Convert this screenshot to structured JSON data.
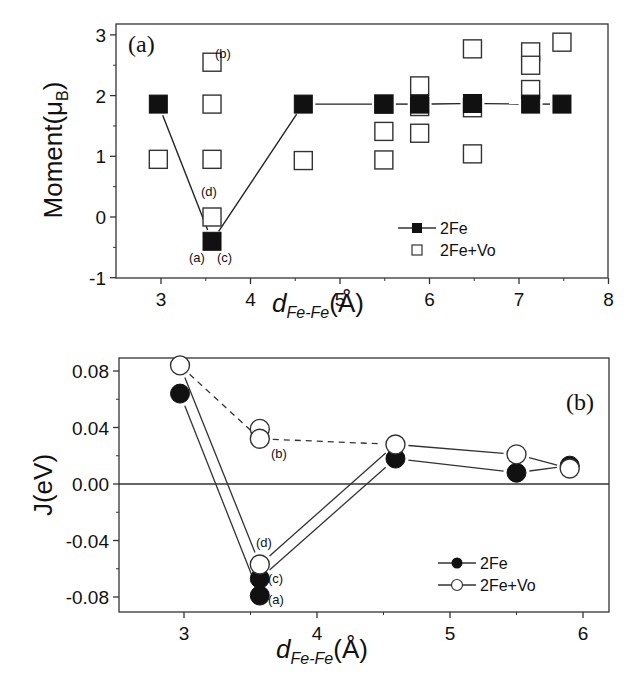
{
  "chart_data": [
    {
      "panel": "(a)",
      "type": "scatter",
      "xlabel": "d_Fe-Fe(Å)",
      "xlabel_main": "d",
      "xlabel_sub": "Fe-Fe",
      "xlabel_unit": "(Å)",
      "ylabel": "Moment(μB)",
      "ylabel_main": "Moment(μ",
      "ylabel_sub": "B",
      "ylabel_close": ")",
      "xlim": [
        2.5,
        8
      ],
      "ylim": [
        -1,
        3.1
      ],
      "xticks": [
        3,
        4,
        5,
        6,
        7,
        8
      ],
      "yticks": [
        -1,
        0,
        1,
        2,
        3
      ],
      "grid": false,
      "legend_position": "lower right",
      "series": [
        {
          "name": "2Fe",
          "marker": "filled-square",
          "line": "solid",
          "x": [
            2.97,
            3.57,
            4.59,
            5.49,
            5.89,
            6.48,
            7.13,
            7.48
          ],
          "y": [
            1.86,
            -0.4,
            1.86,
            1.86,
            1.86,
            1.87,
            1.86,
            1.86
          ]
        },
        {
          "name": "2Fe+Vo",
          "marker": "open-square",
          "line": "none",
          "x": [
            2.97,
            3.57,
            3.57,
            3.57,
            3.57,
            4.59,
            5.49,
            5.49,
            5.49,
            5.89,
            5.89,
            5.89,
            6.48,
            6.48,
            6.48,
            7.13,
            7.13,
            7.13,
            7.48
          ],
          "y": [
            0.95,
            2.55,
            1.86,
            0.95,
            0.0,
            0.93,
            1.86,
            1.41,
            0.94,
            2.16,
            1.82,
            1.38,
            2.77,
            1.8,
            1.04,
            2.72,
            2.5,
            2.1,
            2.88
          ]
        }
      ],
      "annotations": [
        {
          "text": "(b)",
          "x": 3.57,
          "y": 2.55
        },
        {
          "text": "(d)",
          "x": 3.57,
          "y": 0.0
        },
        {
          "text": "(a)",
          "x": 3.57,
          "y": -0.4
        },
        {
          "text": "(c)",
          "x": 3.57,
          "y": -0.4
        }
      ]
    },
    {
      "panel": "(b)",
      "type": "line",
      "xlabel": "d_Fe-Fe(Å)",
      "xlabel_main": "d",
      "xlabel_sub": "Fe-Fe",
      "xlabel_unit": "(Å)",
      "ylabel": "J(eV)",
      "xlim": [
        2.5,
        6.2
      ],
      "ylim": [
        -0.09,
        0.09
      ],
      "xticks": [
        3,
        4,
        5,
        6
      ],
      "yticks": [
        -0.08,
        -0.04,
        0.0,
        0.04,
        0.08
      ],
      "ytick_labels": [
        "-0.08",
        "-0.04",
        "0.00",
        "0.04",
        "0.08"
      ],
      "grid": false,
      "zero_line": true,
      "legend_position": "lower right",
      "series": [
        {
          "name": "2Fe",
          "marker": "filled-circle",
          "line": "solid",
          "x": [
            2.97,
            3.57,
            3.57,
            4.59,
            5.5,
            5.9
          ],
          "y": [
            0.064,
            -0.067,
            -0.079,
            0.018,
            0.008,
            0.013
          ]
        },
        {
          "name": "2Fe+Vo",
          "marker": "open-circle",
          "line": "solid",
          "x": [
            2.97,
            3.57,
            3.57,
            3.57,
            4.59,
            5.5,
            5.9
          ],
          "y": [
            0.084,
            0.039,
            0.032,
            -0.057,
            0.028,
            0.021,
            0.011
          ]
        }
      ],
      "lines": [
        {
          "style": "solid",
          "points": [
            [
              2.97,
              0.064
            ],
            [
              3.57,
              -0.079
            ]
          ]
        },
        {
          "style": "solid",
          "points": [
            [
              3.57,
              -0.067
            ],
            [
              4.59,
              0.018
            ],
            [
              5.5,
              0.008
            ],
            [
              5.9,
              0.013
            ]
          ]
        },
        {
          "style": "solid",
          "points": [
            [
              2.97,
              0.084
            ],
            [
              3.57,
              -0.057
            ],
            [
              4.59,
              0.028
            ],
            [
              5.5,
              0.021
            ],
            [
              5.9,
              0.011
            ]
          ]
        },
        {
          "style": "dashed",
          "points": [
            [
              2.97,
              0.084
            ],
            [
              3.57,
              0.032
            ],
            [
              4.59,
              0.028
            ]
          ]
        }
      ],
      "annotations": [
        {
          "text": "(b)",
          "x": 3.57,
          "y": 0.032
        },
        {
          "text": "(d)",
          "x": 3.57,
          "y": -0.057
        },
        {
          "text": "(c)",
          "x": 3.57,
          "y": -0.067
        },
        {
          "text": "(a)",
          "x": 3.57,
          "y": -0.079
        }
      ]
    }
  ],
  "layout": {
    "panels": [
      {
        "left": 116,
        "right": 608,
        "top": 24,
        "bottom": 278,
        "x0": 3,
        "x0px": 161,
        "xscale": 89.5,
        "y0px": 217,
        "yscale": 60.7,
        "label_pos": [
          128,
          52
        ],
        "legend": {
          "x": 440,
          "y": 228,
          "items": [
            {
              "label": "2Fe",
              "kind": "filled-square-line"
            },
            {
              "label": "2Fe+Vo",
              "kind": "open-square"
            }
          ]
        },
        "annot_px": [
          [
            215,
            58
          ],
          [
            201,
            196
          ],
          [
            189,
            262
          ],
          [
            217,
            262
          ]
        ],
        "xtitle_pos": [
          318,
          312
        ],
        "ytitle_pos": [
          62,
          150
        ]
      },
      {
        "left": 119,
        "right": 609,
        "top": 358,
        "bottom": 612,
        "x0": 3,
        "x0px": 184,
        "xscale": 133,
        "y0px": 484,
        "yscale": 1412.5,
        "label_pos": [
          566,
          410
        ],
        "legend": {
          "x": 480,
          "y": 563,
          "items": [
            {
              "label": "2Fe",
              "kind": "filled-circle-line"
            },
            {
              "label": "2Fe+Vo",
              "kind": "open-circle-line"
            }
          ]
        },
        "annot_px": [
          [
            271,
            458
          ],
          [
            256,
            547
          ],
          [
            268,
            583
          ],
          [
            268,
            604
          ]
        ],
        "xtitle_pos": [
          322,
          658
        ],
        "ytitle_pos": [
          52,
          485
        ]
      }
    ]
  }
}
